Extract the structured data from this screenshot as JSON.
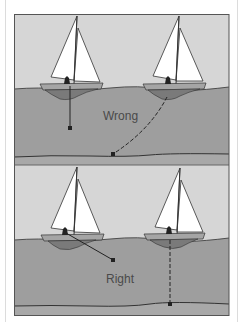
{
  "diagram": {
    "panels": [
      {
        "id": "wrong",
        "label": "Wrong",
        "description": "Anchor line tied from centre/keel of boat: left boat anchor hangs straight down short of seabed; right boat anchor line trails diagonally to seabed"
      },
      {
        "id": "right",
        "label": "Right",
        "description": "Left boat anchor line angled from the cockpit; right boat anchor line dropped vertically from keel to seabed"
      }
    ],
    "colors": {
      "sky": "#d6d6d6",
      "water": "#9e9e9e",
      "sail": "#ffffff",
      "hull": "#a5a5a5",
      "keel": "#7a7a7a",
      "line": "#222222",
      "seabed": "#a8a8a8"
    }
  }
}
